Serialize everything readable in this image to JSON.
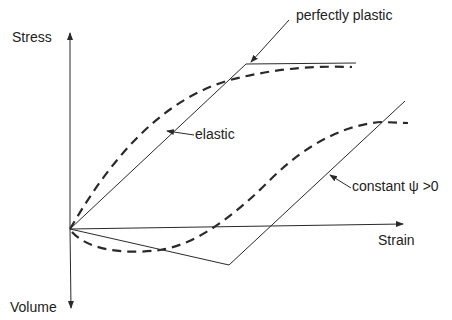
{
  "diagram": {
    "axes": {
      "y_positive_label": "Stress",
      "y_negative_label": "Volume",
      "x_label": "Strain"
    },
    "annotations": {
      "perfectly_plastic": "perfectly plastic",
      "elastic": "elastic",
      "constant_psi": "constant ψ >0"
    },
    "curves": [
      {
        "name": "stress-elastic-perfectly-plastic",
        "style": "solid",
        "description": "Linear elastic rise then flat perfectly plastic plateau"
      },
      {
        "name": "stress-realistic",
        "style": "dashed",
        "description": "Gradual nonlinear rise approaching plateau"
      },
      {
        "name": "volume-idealized",
        "style": "solid",
        "description": "Linear compression then linear dilation at constant dilation angle"
      },
      {
        "name": "volume-realistic",
        "style": "dashed",
        "description": "Initial compression then dilation tending to constant volume"
      }
    ],
    "colors": {
      "ink": "#2a2a2a",
      "background": "#ffffff"
    }
  }
}
